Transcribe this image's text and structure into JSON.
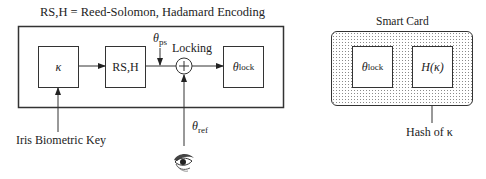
{
  "title": "RS,H = Reed-Solomon, Hadamard Encoding",
  "encoder": {
    "key_box": {
      "label": "κ"
    },
    "rs_box": {
      "label": "RS,H"
    },
    "theta_ps": {
      "symbol": "θ",
      "sub": "ps"
    },
    "locking_label": "Locking",
    "xor_symbol": "+",
    "lock_box": {
      "symbol": "θ",
      "sub": "lock"
    },
    "theta_ref": {
      "symbol": "θ",
      "sub": "ref"
    },
    "key_caption": "Iris Biometric Key",
    "eye_icon": "eye-icon"
  },
  "smart_card": {
    "title": "Smart Card",
    "lock_box": {
      "symbol": "θ",
      "sub": "lock"
    },
    "hash_box": {
      "label": "H(κ)"
    },
    "hash_caption": "Hash of κ"
  },
  "colors": {
    "line": "#333333",
    "dots": "#8a8a8a",
    "background": "#ffffff"
  }
}
